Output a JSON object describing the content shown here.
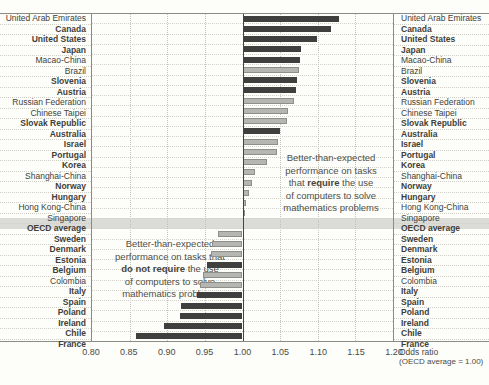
{
  "colors": {
    "dark_bar": "#3f3f3d",
    "light_bar": "#b5b5b1",
    "light_bar_border": "#8f8f8a",
    "oecd_band": "#dbdbd7",
    "baseline": "#44443f"
  },
  "chart_data": {
    "type": "bar",
    "orientation": "horizontal",
    "title": "",
    "xlabel": "Odds ratio",
    "xlabel_note": "(OECD average = 1.00)",
    "xlim": [
      0.8,
      1.2
    ],
    "baseline": 1.0,
    "grid": "dotted-vertical",
    "xticks": [
      "0.80",
      "0.85",
      "0.90",
      "0.95",
      "1.00",
      "1.05",
      "1.10",
      "1.15",
      "1.20"
    ],
    "bar_style_legend": {
      "dark": "dark gray bar",
      "light": "light gray bar"
    },
    "rows": [
      {
        "label": "United Arab Emirates",
        "value": 1.128,
        "style": "dark",
        "bold_label": false,
        "highlight": false
      },
      {
        "label": "Canada",
        "value": 1.117,
        "style": "dark",
        "bold_label": true,
        "highlight": false
      },
      {
        "label": "United States",
        "value": 1.099,
        "style": "dark",
        "bold_label": true,
        "highlight": false
      },
      {
        "label": "Japan",
        "value": 1.078,
        "style": "dark",
        "bold_label": true,
        "highlight": false
      },
      {
        "label": "Macao-China",
        "value": 1.076,
        "style": "dark",
        "bold_label": false,
        "highlight": false
      },
      {
        "label": "Brazil",
        "value": 1.075,
        "style": "light",
        "bold_label": false,
        "highlight": false
      },
      {
        "label": "Slovenia",
        "value": 1.072,
        "style": "dark",
        "bold_label": true,
        "highlight": false
      },
      {
        "label": "Austria",
        "value": 1.071,
        "style": "dark",
        "bold_label": true,
        "highlight": false
      },
      {
        "label": "Russian Federation",
        "value": 1.068,
        "style": "light",
        "bold_label": false,
        "highlight": false
      },
      {
        "label": "Chinese Taipei",
        "value": 1.061,
        "style": "light",
        "bold_label": false,
        "highlight": false
      },
      {
        "label": "Slovak Republic",
        "value": 1.059,
        "style": "light",
        "bold_label": true,
        "highlight": false
      },
      {
        "label": "Australia",
        "value": 1.05,
        "style": "dark",
        "bold_label": true,
        "highlight": false
      },
      {
        "label": "Israel",
        "value": 1.047,
        "style": "light",
        "bold_label": true,
        "highlight": false
      },
      {
        "label": "Portugal",
        "value": 1.046,
        "style": "light",
        "bold_label": true,
        "highlight": false
      },
      {
        "label": "Korea",
        "value": 1.033,
        "style": "light",
        "bold_label": true,
        "highlight": false
      },
      {
        "label": "Shanghai-China",
        "value": 1.017,
        "style": "light",
        "bold_label": false,
        "highlight": false
      },
      {
        "label": "Norway",
        "value": 1.012,
        "style": "light",
        "bold_label": true,
        "highlight": false
      },
      {
        "label": "Hungary",
        "value": 1.009,
        "style": "light",
        "bold_label": true,
        "highlight": false
      },
      {
        "label": "Hong Kong-China",
        "value": 1.004,
        "style": "light",
        "bold_label": false,
        "highlight": false
      },
      {
        "label": "Singapore",
        "value": 1.003,
        "style": "light",
        "bold_label": false,
        "highlight": false
      },
      {
        "label": "OECD average",
        "value": 1.0,
        "style": "none",
        "bold_label": true,
        "highlight": true
      },
      {
        "label": "Sweden",
        "value": 0.967,
        "style": "light",
        "bold_label": true,
        "highlight": false
      },
      {
        "label": "Denmark",
        "value": 0.959,
        "style": "light",
        "bold_label": true,
        "highlight": false
      },
      {
        "label": "Estonia",
        "value": 0.958,
        "style": "light",
        "bold_label": true,
        "highlight": false
      },
      {
        "label": "Belgium",
        "value": 0.953,
        "style": "dark",
        "bold_label": true,
        "highlight": false
      },
      {
        "label": "Colombia",
        "value": 0.948,
        "style": "light",
        "bold_label": false,
        "highlight": false
      },
      {
        "label": "Italy",
        "value": 0.943,
        "style": "light",
        "bold_label": true,
        "highlight": false
      },
      {
        "label": "Spain",
        "value": 0.939,
        "style": "dark",
        "bold_label": true,
        "highlight": false
      },
      {
        "label": "Poland",
        "value": 0.918,
        "style": "dark",
        "bold_label": true,
        "highlight": false
      },
      {
        "label": "Ireland",
        "value": 0.917,
        "style": "dark",
        "bold_label": true,
        "highlight": false
      },
      {
        "label": "Chile",
        "value": 0.896,
        "style": "dark",
        "bold_label": true,
        "highlight": false
      },
      {
        "label": "France",
        "value": 0.859,
        "style": "dark",
        "bold_label": true,
        "highlight": false
      }
    ],
    "annotations": {
      "require": {
        "lines": [
          {
            "pre": "Better-than-expected"
          },
          {
            "pre": "performance on tasks"
          },
          {
            "pre": "that ",
            "bold": "require",
            "post": " the use"
          },
          {
            "pre": "of computers to solve"
          },
          {
            "pre": "mathematics problems"
          }
        ]
      },
      "do_not_require": {
        "lines": [
          {
            "pre": "Better-than-expected"
          },
          {
            "pre": "performance on tasks that"
          },
          {
            "bold": "do not require",
            "post": " the use"
          },
          {
            "pre": "of computers to solve"
          },
          {
            "pre": "mathematics problems"
          }
        ]
      }
    }
  }
}
